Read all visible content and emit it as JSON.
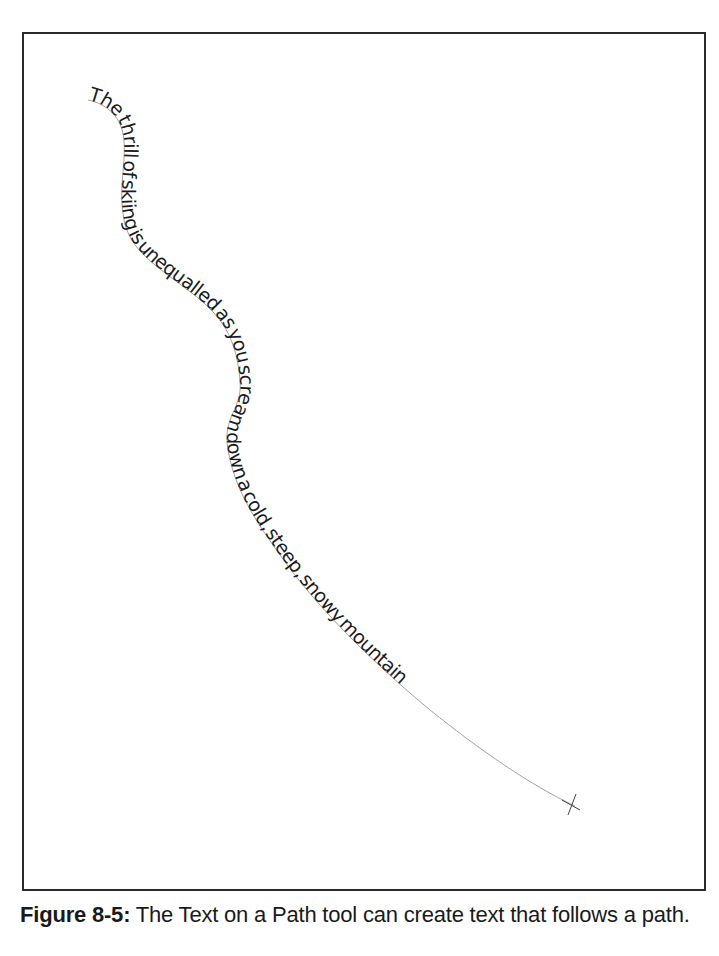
{
  "figure": {
    "path_text": "The thrill of skiing is unequalled as you scream down a cold, steep, snowy mountain",
    "path_points_description": "S-shaped curve from upper-left descending to lower-right",
    "colors": {
      "frame_border": "#2a2a2a",
      "text": "#1c1c1c",
      "guide_path": "#8a8a8a",
      "background": "#ffffff"
    }
  },
  "caption": {
    "label": "Figure 8-5:",
    "text": " The Text on a Path tool can create text that follows a path."
  }
}
